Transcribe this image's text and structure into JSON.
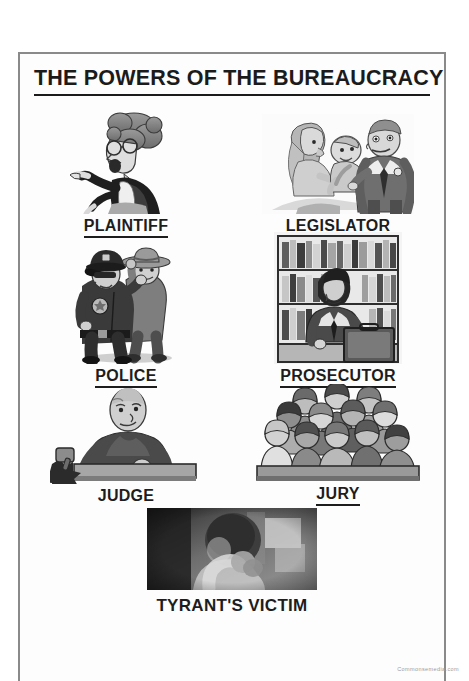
{
  "poster": {
    "title": "THE POWERS OF THE BUREAUCRACY",
    "watermark": "Commonsemedia.com",
    "items": [
      {
        "label": "PLAINTIFF",
        "underlined": true,
        "art": "angry-woman-pointing-cartoon"
      },
      {
        "label": "LEGISLATOR",
        "underlined": true,
        "art": "politician-kissing-baby-cartoon"
      },
      {
        "label": "POLICE",
        "underlined": true,
        "art": "police-officer-arresting-suspect-cartoon"
      },
      {
        "label": "PROSECUTOR",
        "underlined": true,
        "art": "lawyer-with-briefcase-in-law-library-cartoon"
      },
      {
        "label": "JUDGE",
        "underlined": false,
        "art": "judge-at-bench-with-gavel-cartoon"
      },
      {
        "label": "JURY",
        "underlined": true,
        "art": "twelve-jurors-crowd-cartoon"
      }
    ],
    "bottom": {
      "label": "TYRANT'S VICTIM",
      "art": "crying-baby-photo"
    },
    "colors": {
      "ink": "#1d1d1d",
      "border": "#8a8a8a",
      "paper": "#fdfdfd",
      "watermark": "#9b9b9b"
    }
  }
}
